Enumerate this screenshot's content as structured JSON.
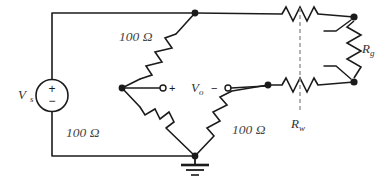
{
  "diagram": {
    "type": "schematic"
  },
  "source": {
    "label": "V",
    "sublabel": "s",
    "plus": "+",
    "minus": "−"
  },
  "output": {
    "label": "V",
    "sublabel": "o",
    "plus": "+",
    "minus": "−"
  },
  "resistors": {
    "bridge_top_left": {
      "value": "100 Ω"
    },
    "bridge_bottom_left": {
      "value": "100 Ω"
    },
    "bridge_bottom_right": {
      "value": "100 Ω"
    },
    "gauge": {
      "label": "R",
      "sublabel": "g"
    },
    "wire": {
      "label": "R",
      "sublabel": "w"
    }
  },
  "ground": {
    "name": "ground-symbol"
  },
  "colors": {
    "wire": "#1b1b1b",
    "dashed_callout": "#8a8a8a",
    "label_text": "#333333",
    "background": "#ffffff"
  }
}
